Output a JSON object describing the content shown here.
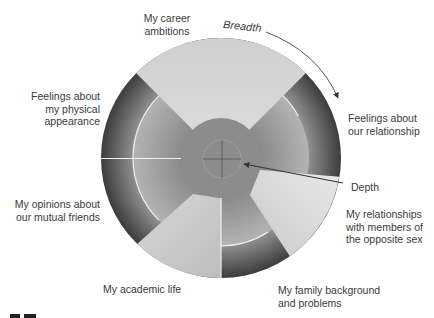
{
  "diagram": {
    "axes": {
      "breadth_label": "Breadth",
      "depth_label": "Depth"
    },
    "topics": [
      {
        "id": "career",
        "label": "My career\nambitions",
        "depth": "shallow"
      },
      {
        "id": "relationship",
        "label": "Feelings about\nour relationship",
        "depth": "deep"
      },
      {
        "id": "opposite_sex",
        "label": "My relationships\nwith members of\nthe opposite sex",
        "depth": "shallow"
      },
      {
        "id": "family",
        "label": "My family background\nand problems",
        "depth": "deep"
      },
      {
        "id": "academic",
        "label": "My academic life",
        "depth": "shallow"
      },
      {
        "id": "friends",
        "label": "My opinions about\nour mutual friends",
        "depth": "deep"
      },
      {
        "id": "appearance",
        "label": "Feelings about\nmy physical\nappearance",
        "depth": "deep"
      }
    ],
    "colors": {
      "light_sector": "#d9d9d9",
      "middle_ring": "#a6a6a6",
      "core": "#8c8c8c",
      "dark_outer": "#4a4a4a",
      "divider": "#f2f2f2",
      "arrow": "#555555"
    }
  }
}
